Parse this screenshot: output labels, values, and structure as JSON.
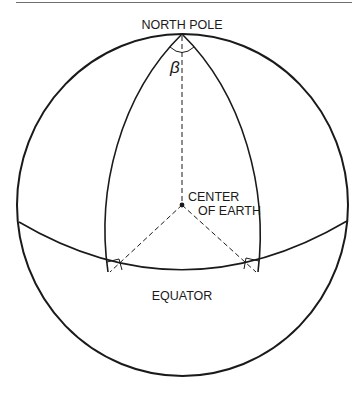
{
  "figure": {
    "type": "globe-diagram",
    "labels": {
      "north_pole": "NORTH POLE",
      "beta": "β",
      "center_line1": "CENTER",
      "center_line2": "OF EARTH",
      "equator": "EQUATOR"
    },
    "colors": {
      "line": "#1a1a1a",
      "rule": "#6f6f6f",
      "background": "#ffffff"
    },
    "elements": [
      "outer-circle",
      "equator-arc",
      "left-meridian",
      "right-meridian",
      "polar-axis-dashed",
      "left-radius-dashed",
      "right-radius-dashed",
      "angle-arc-beta",
      "right-angle-marks",
      "center-point"
    ]
  }
}
